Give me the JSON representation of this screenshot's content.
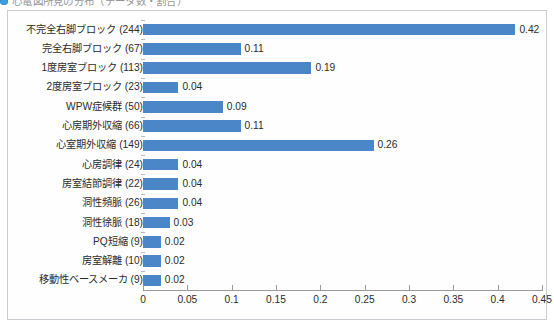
{
  "heading": {
    "bullet_icon": "blue-bullet-icon",
    "text": "心電図所見の分布（データ数・割合）"
  },
  "chart_data": {
    "type": "bar",
    "orientation": "horizontal",
    "title": "",
    "xlabel": "",
    "ylabel": "",
    "xlim": [
      0,
      0.45
    ],
    "grid": false,
    "legend": false,
    "bar_color": "#4a86c8",
    "axis_color": "#9a9a9a",
    "xticks": [
      "0",
      "0.05",
      "0.1",
      "0.15",
      "0.2",
      "0.25",
      "0.3",
      "0.35",
      "0.4",
      "0.45"
    ],
    "xtick_values": [
      0,
      0.05,
      0.1,
      0.15,
      0.2,
      0.25,
      0.3,
      0.35,
      0.4,
      0.45
    ],
    "categories": [
      "不完全右脚ブロック (244)",
      "完全右脚ブロック (67)",
      "1度房室ブロック (113)",
      "2度房室ブロック (23)",
      "WPW症候群 (50)",
      "心房期外収縮 (66)",
      "心室期外収縮 (149)",
      "心房調律 (24)",
      "房室結節調律 (22)",
      "洞性頻脈 (26)",
      "洞性徐脈 (18)",
      "PQ短縮 (9)",
      "房室解離 (10)",
      "移動性ベースメーカ (9)"
    ],
    "values": [
      0.42,
      0.11,
      0.19,
      0.04,
      0.09,
      0.11,
      0.26,
      0.04,
      0.04,
      0.04,
      0.03,
      0.02,
      0.02,
      0.02
    ],
    "value_labels": [
      "0.42",
      "0.11",
      "0.19",
      "0.04",
      "0.09",
      "0.11",
      "0.26",
      "0.04",
      "0.04",
      "0.04",
      "0.03",
      "0.02",
      "0.02",
      "0.02"
    ],
    "counts": [
      244,
      67,
      113,
      23,
      50,
      66,
      149,
      24,
      22,
      26,
      18,
      9,
      10,
      9
    ]
  }
}
